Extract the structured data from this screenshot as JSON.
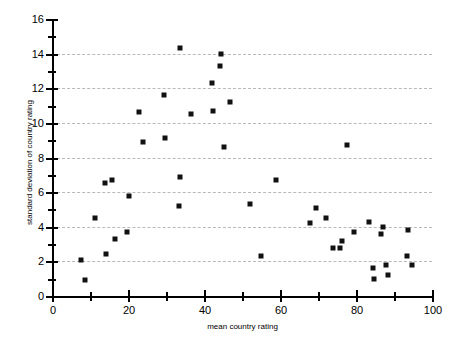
{
  "chart_data": {
    "type": "scatter",
    "title": "",
    "xlabel": "mean country rating",
    "ylabel": "standard deviation of country rating",
    "xlim": [
      0,
      100
    ],
    "ylim": [
      0,
      16
    ],
    "x_major_ticks": [
      0,
      20,
      40,
      60,
      80,
      100
    ],
    "x_minor_ticks": [
      10,
      30,
      50,
      70,
      90
    ],
    "x_tick_labels": [
      "0",
      "20",
      "40",
      "60",
      "80",
      "100"
    ],
    "y_major_ticks": [
      0,
      2,
      4,
      6,
      8,
      10,
      12,
      14,
      16
    ],
    "y_minor_ticks": [
      1,
      3,
      5,
      7,
      9,
      11,
      13,
      15
    ],
    "y_tick_labels": [
      "0",
      "2",
      "4",
      "6",
      "8",
      "10",
      "12",
      "14",
      "16"
    ],
    "gridlines": {
      "horizontal": [
        2,
        4,
        6,
        8,
        10,
        12,
        14
      ],
      "vertical": [],
      "style": "dashed",
      "color": "#b9b9b9"
    },
    "legend": null,
    "marker": {
      "shape": "square",
      "color": "#111111",
      "size": 5
    },
    "points": [
      {
        "x": 7.6,
        "y": 2.1
      },
      {
        "x": 8.7,
        "y": 0.9
      },
      {
        "x": 11.3,
        "y": 4.5
      },
      {
        "x": 13.9,
        "y": 6.5
      },
      {
        "x": 14.2,
        "y": 2.4
      },
      {
        "x": 15.8,
        "y": 6.7
      },
      {
        "x": 16.6,
        "y": 3.3
      },
      {
        "x": 19.7,
        "y": 3.7
      },
      {
        "x": 20.3,
        "y": 5.8
      },
      {
        "x": 22.9,
        "y": 10.6
      },
      {
        "x": 23.9,
        "y": 8.9
      },
      {
        "x": 29.5,
        "y": 11.6
      },
      {
        "x": 29.7,
        "y": 9.1
      },
      {
        "x": 33.5,
        "y": 5.2
      },
      {
        "x": 33.6,
        "y": 6.9
      },
      {
        "x": 33.7,
        "y": 14.3
      },
      {
        "x": 36.6,
        "y": 10.5
      },
      {
        "x": 42.1,
        "y": 12.3
      },
      {
        "x": 42.3,
        "y": 10.7
      },
      {
        "x": 44.2,
        "y": 13.3
      },
      {
        "x": 44.5,
        "y": 14.0
      },
      {
        "x": 45.3,
        "y": 8.6
      },
      {
        "x": 46.8,
        "y": 11.2
      },
      {
        "x": 52.1,
        "y": 5.3
      },
      {
        "x": 55.0,
        "y": 2.3
      },
      {
        "x": 59.0,
        "y": 6.7
      },
      {
        "x": 67.9,
        "y": 4.2
      },
      {
        "x": 69.5,
        "y": 5.1
      },
      {
        "x": 72.1,
        "y": 4.5
      },
      {
        "x": 74.0,
        "y": 2.8
      },
      {
        "x": 75.8,
        "y": 2.8
      },
      {
        "x": 76.3,
        "y": 3.2
      },
      {
        "x": 77.6,
        "y": 8.7
      },
      {
        "x": 79.5,
        "y": 3.7
      },
      {
        "x": 83.4,
        "y": 4.3
      },
      {
        "x": 84.5,
        "y": 1.6
      },
      {
        "x": 84.7,
        "y": 1.0
      },
      {
        "x": 86.6,
        "y": 3.6
      },
      {
        "x": 87.1,
        "y": 4.0
      },
      {
        "x": 87.9,
        "y": 1.8
      },
      {
        "x": 88.4,
        "y": 1.2
      },
      {
        "x": 93.4,
        "y": 2.3
      },
      {
        "x": 93.7,
        "y": 3.8
      },
      {
        "x": 94.7,
        "y": 1.8
      }
    ]
  }
}
